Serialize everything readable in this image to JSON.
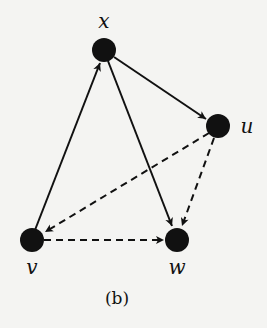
{
  "nodes": {
    "x": {
      "label": "x"
    },
    "u": {
      "label": "u"
    },
    "v": {
      "label": "v"
    },
    "w": {
      "label": "w"
    }
  },
  "edges": [
    {
      "from": "v",
      "to": "x",
      "style": "solid"
    },
    {
      "from": "x",
      "to": "u",
      "style": "solid"
    },
    {
      "from": "x",
      "to": "w",
      "style": "solid"
    },
    {
      "from": "u",
      "to": "v",
      "style": "dashed"
    },
    {
      "from": "u",
      "to": "w",
      "style": "dashed"
    },
    {
      "from": "v",
      "to": "w",
      "style": "dashed"
    }
  ],
  "caption": "(b)",
  "colors": {
    "node": "#111111",
    "edge": "#111111",
    "background": "#f4f4f2"
  }
}
